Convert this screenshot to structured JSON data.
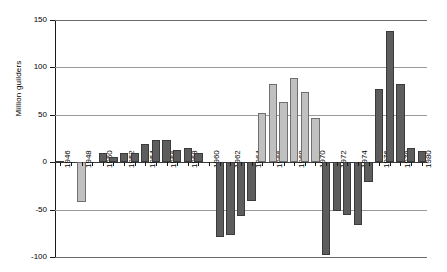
{
  "chart_data": {
    "type": "bar",
    "title": "",
    "subtitle": "",
    "xlabel": "",
    "ylabel": "Million guilders",
    "ylim": [
      -100,
      150
    ],
    "yticks": [
      150,
      100,
      50,
      0,
      -50,
      -100
    ],
    "ytick_labels": [
      "150",
      "100",
      "50",
      "0",
      "-50",
      "-100"
    ],
    "grid": true,
    "legend": "none",
    "xlabel_interval": 2,
    "x_tick_labels": [
      "1946",
      "1948",
      "1950",
      "1952",
      "1954",
      "1956",
      "1958",
      "1960",
      "1962",
      "1964",
      "1966",
      "1968",
      "1970",
      "1972",
      "1974",
      "1976",
      "1978",
      "1980"
    ],
    "categories": [
      "1946",
      "1947",
      "1948",
      "1949",
      "1950",
      "1951",
      "1952",
      "1953",
      "1954",
      "1955",
      "1956",
      "1957",
      "1958",
      "1959",
      "1960",
      "1961",
      "1962",
      "1963",
      "1964",
      "1965",
      "1966",
      "1967",
      "1968",
      "1969",
      "1970",
      "1971",
      "1972",
      "1973",
      "1974",
      "1975",
      "1976",
      "1977",
      "1978",
      "1979",
      "1980"
    ],
    "values": [
      1,
      0,
      -42,
      0,
      10,
      5,
      10,
      10,
      19,
      23,
      23,
      13,
      15,
      10,
      0,
      -79,
      -77,
      -57,
      -41,
      52,
      82,
      63,
      89,
      74,
      47,
      -98,
      -51,
      -56,
      -66,
      -21,
      77,
      138,
      82,
      15,
      12
    ],
    "bar_colors": [
      "dark",
      "dark",
      "light",
      "dark",
      "dark",
      "dark",
      "dark",
      "dark",
      "dark",
      "dark",
      "dark",
      "dark",
      "dark",
      "dark",
      "dark",
      "dark",
      "dark",
      "dark",
      "dark",
      "light",
      "light",
      "light",
      "light",
      "light",
      "light",
      "dark",
      "dark",
      "dark",
      "dark",
      "dark",
      "dark",
      "dark",
      "dark",
      "dark",
      "dark"
    ],
    "palette": {
      "dark": "#5d5d5d",
      "light": "#c0c0c0",
      "bar_border": "#3b3b3b",
      "gridline": "#9a9a9a",
      "axis": "#1a1a1a",
      "background": "#ffffff"
    }
  }
}
